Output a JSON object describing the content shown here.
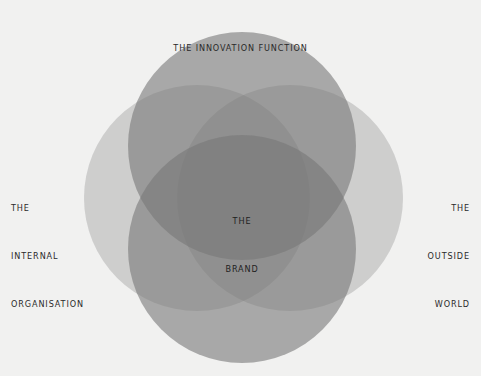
{
  "diagram": {
    "type": "venn",
    "background": "#f1f1f0",
    "labels": {
      "top": [
        "THE INNOVATION FUNCTION"
      ],
      "left": [
        "THE",
        "INTERNAL",
        "ORGANISATION"
      ],
      "right": [
        "THE",
        "OUTSIDE",
        "WORLD"
      ],
      "center": [
        "THE",
        "BRAND"
      ]
    },
    "circles": [
      {
        "name": "left",
        "cx": 197,
        "cy": 198,
        "r": 113,
        "fill": "#787878",
        "opacity": 0.29
      },
      {
        "name": "right",
        "cx": 290,
        "cy": 198,
        "r": 113,
        "fill": "#787878",
        "opacity": 0.29
      },
      {
        "name": "top",
        "cx": 242,
        "cy": 146,
        "r": 114,
        "fill": "#787878",
        "opacity": 0.6
      },
      {
        "name": "bottom",
        "cx": 242,
        "cy": 249,
        "r": 114,
        "fill": "#787878",
        "opacity": 0.6
      }
    ]
  }
}
